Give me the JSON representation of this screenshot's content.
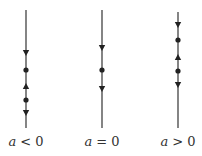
{
  "panels": [
    {
      "label_var": "a",
      "label_rel": "< 0",
      "markers": [
        "arrow-down",
        "dot",
        "arrow-up",
        "dot",
        "arrow-down"
      ]
    },
    {
      "label_var": "a",
      "label_rel": "= 0",
      "markers": [
        "arrow-down",
        "dot",
        "arrow-down"
      ]
    },
    {
      "label_var": "a",
      "label_rel": "> 0",
      "markers": [
        "arrow-down",
        "dot",
        "arrow-up",
        "dot",
        "arrow-down"
      ]
    }
  ],
  "colors": {
    "line": "#333333",
    "marker": "#222222",
    "text": "#333333"
  }
}
